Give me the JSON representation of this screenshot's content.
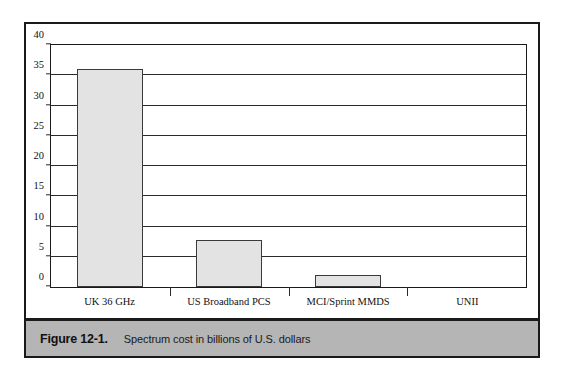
{
  "figure": {
    "label": "Figure 12-1.",
    "caption": "Spectrum cost in billions of U.S. dollars",
    "band_color": "#b5b5b5",
    "frame_color": "#1a1a1a"
  },
  "chart_data": {
    "type": "bar",
    "title": "",
    "xlabel": "",
    "ylabel": "",
    "categories": [
      "UK 36 GHz",
      "US Broadband PCS",
      "MCI/Sprint MMDS",
      "UNII"
    ],
    "values": [
      36,
      7.8,
      2,
      0
    ],
    "ylim": [
      0,
      40
    ],
    "ytick_values": [
      0,
      5,
      10,
      15,
      20,
      25,
      30,
      35,
      40
    ],
    "ytick_labels": [
      "0",
      "5",
      "10",
      "15",
      "20",
      "25",
      "30",
      "35",
      "40"
    ],
    "grid": true,
    "legend": "none",
    "bar_fill": "#e3e3e3",
    "bar_stroke": "#3a3a3a"
  }
}
